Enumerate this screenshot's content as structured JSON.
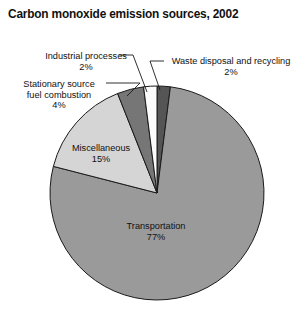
{
  "chart": {
    "title": "Carbon monoxide emission sources, 2002"
  },
  "labels": {
    "industrial": {
      "name": "Industrial processes",
      "pct": "2%"
    },
    "stationary": {
      "name_line1": "Stationary source",
      "name_line2": "fuel combustion",
      "pct": "4%"
    },
    "waste": {
      "name": "Waste disposal and recycling",
      "pct": "2%"
    },
    "miscellaneous": {
      "name": "Miscellaneous",
      "pct": "15%"
    },
    "transportation": {
      "name": "Transportation",
      "pct": "77%"
    }
  },
  "chart_data": {
    "type": "pie",
    "title": "Carbon monoxide emission sources, 2002",
    "subtitle": "",
    "xlabel": "",
    "ylabel": "",
    "grid": false,
    "legend_position": "none",
    "units": "percent",
    "start_angle_deg": 0,
    "direction": "clockwise",
    "categories": [
      "Waste disposal and recycling",
      "Transportation",
      "Miscellaneous",
      "Stationary source fuel combustion",
      "Industrial processes"
    ],
    "values": [
      2,
      77,
      15,
      4,
      2
    ],
    "value_labels": [
      "2%",
      "77%",
      "15%",
      "4%",
      "2%"
    ],
    "label_placement": [
      "outside",
      "inside",
      "inside",
      "outside",
      "outside"
    ],
    "colors": [
      "#555555",
      "#9a9a9a",
      "#d5d5d5",
      "#767676",
      "#fbfbfb"
    ],
    "stroke_color": "#1a1a1a",
    "center": {
      "x": 157,
      "y": 193
    },
    "radius": 107
  },
  "style": {
    "background": "#ffffff",
    "text_color": "#111111",
    "outline": "#1a1a1a",
    "slice_waste": "#555555",
    "slice_transportation": "#9a9a9a",
    "slice_miscellaneous": "#d5d5d5",
    "slice_stationary": "#767676",
    "slice_industrial": "#fbfbfb"
  }
}
